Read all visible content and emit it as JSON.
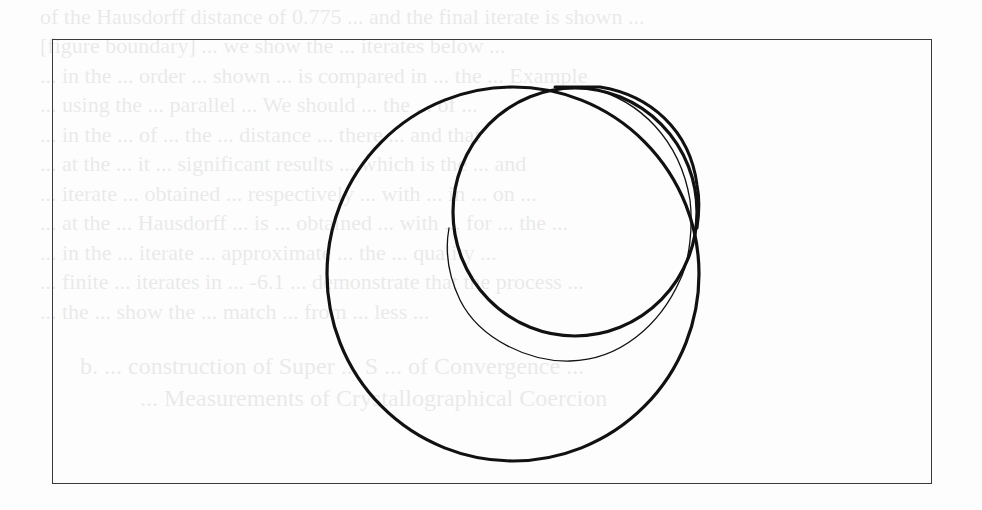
{
  "document": {
    "type": "scanned-page-figure",
    "background_color": "#fdfdfd",
    "ink_color": "#111111"
  },
  "bleed_through_text": {
    "note": "faint mirrored text from reverse side of page, mostly illegible",
    "lines": [
      "of the Hausdorff distance of 0.775 ... and the final iterate is shown ...",
      "[figure boundary] ... we show the ... iterates below ...",
      "... in the ... order ... shown ... is compared in ... the ... Example",
      "... using the ... parallel ... We should ... the ... of ...",
      "... in the ... of ... the ... distance ... there ... and that",
      "... at the ... it ... significant results ... which is the ... and",
      "... iterate ... obtained ... respectively ... with ... in ... on ...",
      "... at the ... Hausdorff ... is ... obtained ... with ... for ... the ...",
      "... in the ... iterate ... approximate ... the ... quality ...",
      "... finite ... iterates in ... -6.1 ... demonstrate that the process ...",
      "... the ... show the ... match ... from ... less ..."
    ],
    "caption_lines": [
      "b. ... construction of Super ... S ... of Convergence ...",
      "... Measurements of Crystallographical Coercion"
    ]
  },
  "figure": {
    "frame": {
      "x": 52,
      "y": 39,
      "width": 880,
      "height": 445
    },
    "shapes": {
      "large_circle": {
        "cx": 513,
        "cy": 274,
        "rx": 186,
        "ry": 187,
        "stroke_width": 3.2
      },
      "small_circle": {
        "cx": 575,
        "cy": 212,
        "rx": 122,
        "ry": 124,
        "stroke_width": 3.2
      },
      "outer_right_arc": {
        "d": "M 555 87 L 600 87 C 650 95 690 130 697 185 C 700 200 699 215 697 228",
        "stroke_width": 3
      },
      "thin_arc": {
        "d": "M 590 88 C 640 100 680 140 690 200 C 693 225 690 260 680 280 C 660 325 620 360 570 361 C 530 362 480 340 460 300 C 448 275 445 250 449 228",
        "stroke_width": 1.3
      }
    }
  }
}
